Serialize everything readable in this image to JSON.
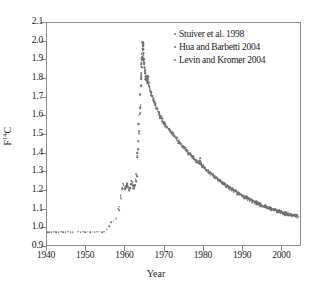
{
  "chart_data": {
    "type": "scatter",
    "title": "",
    "xlabel": "Year",
    "ylabel": "F14C",
    "ylabel_display": "F",
    "ylabel_sup": "14",
    "ylabel_tail": "C",
    "xlim": [
      1940,
      2005
    ],
    "ylim": [
      0.9,
      2.1
    ],
    "grid": false,
    "legend_position": "top-right",
    "marker_color": "#6e6e6e",
    "axis_color": "#8a8a8a",
    "xticks": [
      1940,
      1950,
      1960,
      1970,
      1980,
      1990,
      2000
    ],
    "xticklabels": [
      "1940",
      "1950",
      "1960",
      "1970",
      "1980",
      "1990",
      "2000"
    ],
    "yticks": [
      0.9,
      1.0,
      1.1,
      1.2,
      1.3,
      1.4,
      1.5,
      1.6,
      1.7,
      1.8,
      1.9,
      2.0,
      2.1
    ],
    "yticklabels": [
      "0.9",
      "1.0",
      "1.1",
      "1.2",
      "1.3",
      "1.4",
      "1.5",
      "1.6",
      "1.7",
      "1.8",
      "1.9",
      "2.0",
      "2.1"
    ],
    "legend": [
      {
        "label": "Stuiver et al. 1998",
        "marker": "dot",
        "color": "#6e6e6e"
      },
      {
        "label": "Hua and Barbetti 2004",
        "marker": "dot",
        "color": "#6e6e6e"
      },
      {
        "label": "Levin and Kromer 2004",
        "marker": "dot",
        "color": "#6e6e6e"
      }
    ],
    "series": [
      {
        "name": "Stuiver et al. 1998",
        "points": [
          [
            1940.0,
            0.978
          ],
          [
            1940.6,
            0.98
          ],
          [
            1941.2,
            0.979
          ],
          [
            1941.8,
            0.981
          ],
          [
            1942.4,
            0.979
          ],
          [
            1943.0,
            0.98
          ],
          [
            1943.6,
            0.982
          ],
          [
            1944.2,
            0.98
          ],
          [
            1944.8,
            0.979
          ],
          [
            1945.4,
            0.981
          ],
          [
            1946.0,
            0.98
          ],
          [
            1946.6,
            0.979
          ],
          [
            1948.0,
            0.981
          ],
          [
            1948.6,
            0.98
          ],
          [
            1949.2,
            0.982
          ],
          [
            1949.8,
            0.98
          ],
          [
            1950.4,
            0.981
          ],
          [
            1951.0,
            0.979
          ],
          [
            1951.6,
            0.981
          ],
          [
            1952.2,
            0.98
          ],
          [
            1952.8,
            0.982
          ],
          [
            1953.4,
            0.981
          ],
          [
            1954.0,
            0.98
          ],
          [
            1954.6,
            0.982
          ]
        ]
      },
      {
        "name": "Hua and Barbetti 2004",
        "points": [
          [
            1955.2,
            0.995
          ],
          [
            1955.8,
            1.01
          ],
          [
            1956.4,
            1.032
          ],
          [
            1957.0,
            1.04
          ],
          [
            1957.6,
            1.052
          ],
          [
            1958.2,
            1.105
          ],
          [
            1958.8,
            1.168
          ],
          [
            1959.2,
            1.215
          ],
          [
            1959.5,
            1.232
          ],
          [
            1959.8,
            1.222
          ],
          [
            1960.0,
            1.21
          ],
          [
            1960.2,
            1.228
          ],
          [
            1960.4,
            1.242
          ],
          [
            1960.6,
            1.225
          ],
          [
            1960.8,
            1.212
          ],
          [
            1961.0,
            1.205
          ],
          [
            1961.2,
            1.218
          ],
          [
            1961.4,
            1.235
          ],
          [
            1961.6,
            1.25
          ],
          [
            1961.8,
            1.24
          ],
          [
            1962.0,
            1.222
          ],
          [
            1962.2,
            1.215
          ],
          [
            1962.4,
            1.232
          ],
          [
            1962.6,
            1.262
          ],
          [
            1962.8,
            1.29
          ],
          [
            1963.0,
            1.38
          ],
          [
            1963.1,
            1.41
          ],
          [
            1963.2,
            1.425
          ],
          [
            1963.3,
            1.47
          ],
          [
            1963.4,
            1.51
          ],
          [
            1963.5,
            1.56
          ],
          [
            1963.6,
            1.61
          ],
          [
            1963.7,
            1.65
          ],
          [
            1963.8,
            1.72
          ],
          [
            1963.9,
            1.765
          ],
          [
            1964.0,
            1.8
          ],
          [
            1964.05,
            1.83
          ],
          [
            1964.1,
            1.86
          ],
          [
            1964.15,
            1.885
          ],
          [
            1964.2,
            1.905
          ],
          [
            1964.25,
            1.92
          ],
          [
            1964.3,
            1.935
          ],
          [
            1964.35,
            1.955
          ],
          [
            1964.4,
            1.975
          ],
          [
            1964.45,
            1.99
          ],
          [
            1964.5,
            1.985
          ],
          [
            1964.55,
            1.96
          ],
          [
            1964.6,
            1.93
          ],
          [
            1964.7,
            1.905
          ],
          [
            1964.8,
            1.885
          ],
          [
            1964.9,
            1.862
          ],
          [
            1965.0,
            1.845
          ],
          [
            1965.1,
            1.83
          ],
          [
            1965.2,
            1.812
          ],
          [
            1965.3,
            1.8
          ],
          [
            1965.4,
            1.79
          ],
          [
            1965.5,
            1.805
          ],
          [
            1965.6,
            1.818
          ],
          [
            1965.7,
            1.8
          ],
          [
            1965.8,
            1.785
          ],
          [
            1965.9,
            1.772
          ],
          [
            1966.0,
            1.762
          ],
          [
            1966.2,
            1.748
          ],
          [
            1966.4,
            1.735
          ],
          [
            1966.6,
            1.722
          ],
          [
            1966.8,
            1.71
          ],
          [
            1967.0,
            1.7
          ],
          [
            1967.2,
            1.688
          ],
          [
            1967.4,
            1.676
          ],
          [
            1967.6,
            1.665
          ],
          [
            1967.8,
            1.652
          ],
          [
            1968.0,
            1.64
          ],
          [
            1968.3,
            1.625
          ],
          [
            1968.6,
            1.612
          ],
          [
            1968.9,
            1.6
          ],
          [
            1969.2,
            1.588
          ],
          [
            1969.5,
            1.578
          ],
          [
            1969.8,
            1.568
          ],
          [
            1970.1,
            1.558
          ],
          [
            1970.4,
            1.548
          ],
          [
            1970.7,
            1.54
          ],
          [
            1971.0,
            1.53
          ],
          [
            1971.3,
            1.522
          ],
          [
            1971.6,
            1.515
          ],
          [
            1971.9,
            1.508
          ]
        ]
      },
      {
        "name": "Levin and Kromer 2004",
        "points": [
          [
            1972.2,
            1.5
          ],
          [
            1972.5,
            1.492
          ],
          [
            1972.8,
            1.485
          ],
          [
            1973.1,
            1.478
          ],
          [
            1973.4,
            1.47
          ],
          [
            1973.7,
            1.462
          ],
          [
            1974.0,
            1.455
          ],
          [
            1974.3,
            1.448
          ],
          [
            1974.6,
            1.441
          ],
          [
            1974.9,
            1.434
          ],
          [
            1975.2,
            1.427
          ],
          [
            1975.5,
            1.42
          ],
          [
            1975.8,
            1.413
          ],
          [
            1976.1,
            1.406
          ],
          [
            1976.4,
            1.399
          ],
          [
            1976.7,
            1.392
          ],
          [
            1977.0,
            1.386
          ],
          [
            1977.3,
            1.38
          ],
          [
            1977.6,
            1.374
          ],
          [
            1977.9,
            1.368
          ],
          [
            1978.2,
            1.362
          ],
          [
            1978.5,
            1.356
          ],
          [
            1978.8,
            1.35
          ],
          [
            1979.0,
            1.375
          ],
          [
            1979.1,
            1.344
          ],
          [
            1979.4,
            1.338
          ],
          [
            1979.7,
            1.332
          ],
          [
            1980.0,
            1.326
          ],
          [
            1980.3,
            1.32
          ],
          [
            1980.6,
            1.314
          ],
          [
            1980.9,
            1.308
          ],
          [
            1981.2,
            1.302
          ],
          [
            1981.5,
            1.297
          ],
          [
            1981.8,
            1.292
          ],
          [
            1982.1,
            1.287
          ],
          [
            1982.4,
            1.282
          ],
          [
            1982.7,
            1.277
          ],
          [
            1983.0,
            1.272
          ],
          [
            1983.3,
            1.267
          ],
          [
            1983.6,
            1.262
          ],
          [
            1983.9,
            1.257
          ],
          [
            1984.2,
            1.252
          ],
          [
            1984.5,
            1.247
          ],
          [
            1984.8,
            1.243
          ],
          [
            1985.1,
            1.238
          ],
          [
            1985.4,
            1.234
          ],
          [
            1985.7,
            1.229
          ],
          [
            1986.0,
            1.225
          ],
          [
            1986.3,
            1.221
          ],
          [
            1986.6,
            1.216
          ],
          [
            1986.9,
            1.212
          ],
          [
            1987.2,
            1.208
          ],
          [
            1987.5,
            1.204
          ],
          [
            1987.8,
            1.2
          ],
          [
            1988.1,
            1.196
          ],
          [
            1988.4,
            1.192
          ],
          [
            1988.7,
            1.188
          ],
          [
            1989.0,
            1.184
          ],
          [
            1989.3,
            1.181
          ],
          [
            1989.6,
            1.177
          ],
          [
            1989.9,
            1.173
          ],
          [
            1990.2,
            1.17
          ],
          [
            1990.5,
            1.166
          ],
          [
            1990.8,
            1.163
          ],
          [
            1991.1,
            1.159
          ],
          [
            1991.4,
            1.156
          ],
          [
            1991.7,
            1.153
          ],
          [
            1992.0,
            1.15
          ],
          [
            1992.3,
            1.147
          ],
          [
            1992.6,
            1.144
          ],
          [
            1992.9,
            1.141
          ],
          [
            1993.2,
            1.138
          ],
          [
            1993.5,
            1.135
          ],
          [
            1993.8,
            1.132
          ],
          [
            1994.1,
            1.129
          ],
          [
            1994.4,
            1.127
          ],
          [
            1994.7,
            1.124
          ],
          [
            1995.0,
            1.121
          ],
          [
            1995.3,
            1.119
          ],
          [
            1995.6,
            1.116
          ],
          [
            1995.9,
            1.114
          ],
          [
            1996.2,
            1.111
          ],
          [
            1996.5,
            1.109
          ],
          [
            1996.8,
            1.107
          ],
          [
            1997.1,
            1.104
          ],
          [
            1997.4,
            1.102
          ],
          [
            1997.7,
            1.1
          ],
          [
            1998.0,
            1.098
          ],
          [
            1998.3,
            1.096
          ],
          [
            1998.6,
            1.094
          ],
          [
            1998.9,
            1.092
          ],
          [
            1999.2,
            1.09
          ],
          [
            1999.5,
            1.088
          ],
          [
            1999.8,
            1.086
          ],
          [
            2000.1,
            1.084
          ],
          [
            2000.4,
            1.082
          ],
          [
            2000.7,
            1.08
          ],
          [
            2001.0,
            1.078
          ],
          [
            2001.3,
            1.077
          ],
          [
            2001.6,
            1.075
          ],
          [
            2001.9,
            1.073
          ],
          [
            2002.2,
            1.072
          ],
          [
            2002.5,
            1.07
          ],
          [
            2002.8,
            1.069
          ],
          [
            2003.1,
            1.067
          ],
          [
            2003.4,
            1.066
          ],
          [
            2003.7,
            1.064
          ],
          [
            2004.0,
            1.063
          ]
        ]
      }
    ],
    "scatter_noise": {
      "dense_band_years": [
        1964.5,
        2004
      ],
      "description": "dense overlapping measurement cloud along decay curve"
    }
  }
}
